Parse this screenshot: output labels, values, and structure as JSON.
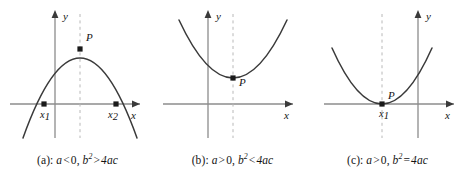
{
  "figure": {
    "background_color": "#ffffff",
    "curve_color": "#3a3a3a",
    "axis_color": "#8c8c8c",
    "dash_color": "#b8b8b8",
    "marker_color": "#1a1a1a",
    "text_color": "#141414"
  },
  "panels": [
    {
      "id": "a",
      "caption_prefix": "(a):",
      "coefficient_condition": "a < 0",
      "discriminant_condition": "b² > 4ac",
      "caption_a_symbol": "a",
      "caption_a_operator": "<",
      "caption_a_value": "0,",
      "caption_b_symbol": "b",
      "caption_b_exponent": "2",
      "caption_b_operator": ">",
      "caption_b_value": "4ac",
      "axis_x_label": "x",
      "axis_y_label": "y",
      "vertex_label": "P",
      "root_labels": [
        {
          "base": "x",
          "sub": "1"
        },
        {
          "base": "x",
          "sub": "2"
        }
      ],
      "opens": "down",
      "roots_count": 2,
      "description": "Downward parabola crossing the x-axis at two points x1 and x2, vertex P above the axis"
    },
    {
      "id": "b",
      "caption_prefix": "(b):",
      "coefficient_condition": "a > 0",
      "discriminant_condition": "b² < 4ac",
      "caption_a_symbol": "a",
      "caption_a_operator": ">",
      "caption_a_value": "0,",
      "caption_b_symbol": "b",
      "caption_b_exponent": "2",
      "caption_b_operator": "<",
      "caption_b_value": "4ac",
      "axis_x_label": "x",
      "axis_y_label": "y",
      "vertex_label": "P",
      "root_labels": [],
      "opens": "up",
      "roots_count": 0,
      "description": "Upward parabola lying entirely above the x-axis, vertex P above the axis"
    },
    {
      "id": "c",
      "caption_prefix": "(c):",
      "coefficient_condition": "a > 0",
      "discriminant_condition": "b² = 4ac",
      "caption_a_symbol": "a",
      "caption_a_operator": ">",
      "caption_a_value": "0,",
      "caption_b_symbol": "b",
      "caption_b_exponent": "2",
      "caption_b_operator": "=",
      "caption_b_value": "4ac",
      "axis_x_label": "x",
      "axis_y_label": "y",
      "vertex_label": "P",
      "root_labels": [
        {
          "base": "x",
          "sub": "1"
        }
      ],
      "opens": "up",
      "roots_count": 1,
      "description": "Upward parabola tangent to the x-axis at a single point x1 which coincides with vertex P"
    }
  ]
}
